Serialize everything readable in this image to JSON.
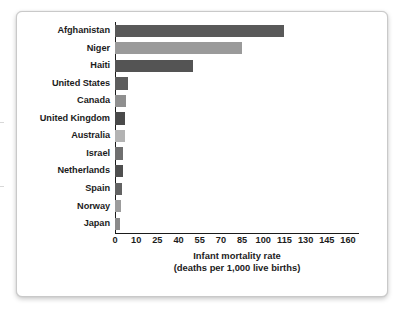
{
  "chart_data": {
    "type": "bar",
    "orientation": "horizontal",
    "title": "",
    "xlabel": "Infant mortality rate",
    "xlabel_line2": "(deaths per 1,000 live births)",
    "ylabel": "",
    "categories": [
      "Afghanistan",
      "Niger",
      "Haiti",
      "United States",
      "Canada",
      "United Kingdom",
      "Australia",
      "Israel",
      "Netherlands",
      "Spain",
      "Norway",
      "Japan"
    ],
    "values": [
      115,
      85,
      50,
      6,
      5,
      4.5,
      4.5,
      4,
      4,
      3.5,
      3,
      2.5
    ],
    "bar_colors": [
      "#595959",
      "#9a9a9a",
      "#545454",
      "#5d5d5d",
      "#8f8f8f",
      "#4a4a4a",
      "#b3b3b3",
      "#6f6f6f",
      "#4f4f4f",
      "#636363",
      "#9c9c9c",
      "#8a8a8a"
    ],
    "xticks": [
      0,
      10,
      25,
      40,
      55,
      70,
      85,
      100,
      115,
      130,
      145,
      160
    ],
    "xtick_labels": [
      "0",
      "10",
      "25",
      "40",
      "55",
      "70",
      "85",
      "100",
      "115",
      "130",
      "145",
      "160"
    ],
    "xlim": [
      0,
      160
    ],
    "grid": false,
    "legend": false,
    "axis_color": "#1b1b1b",
    "background": "#ffffff",
    "frame_border_color": "#c9c9c9"
  }
}
